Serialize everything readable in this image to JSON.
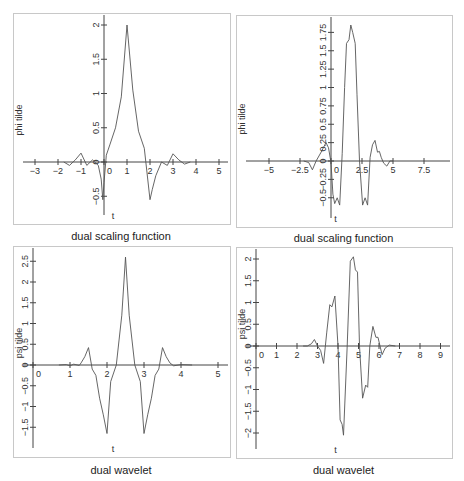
{
  "chart_data": [
    {
      "id": "p1",
      "type": "line",
      "title": "dual scaling function",
      "xlabel": "t",
      "ylabel": "phi tilde",
      "xlim": [
        -3.4,
        5.4
      ],
      "ylim": [
        -0.75,
        2.15
      ],
      "xticks": [
        -3,
        -2,
        -1,
        0,
        1,
        2,
        3,
        4,
        5
      ],
      "xtick_labels": [
        "−3",
        "−2",
        "−1",
        "0",
        "1",
        "2",
        "3",
        "4",
        "5"
      ],
      "yticks": [
        -0.5,
        0,
        0.5,
        1,
        1.5,
        2
      ],
      "ytick_labels": [
        "−0.5",
        "0",
        "0.5",
        "1",
        "1.5",
        "2"
      ],
      "grid": false,
      "frame": {
        "left": 13,
        "top": 13,
        "right": 229,
        "bottom": 223
      },
      "axis_px": {
        "x0": 104,
        "xscale": 23.0,
        "y0": 162,
        "yscale": 68.5
      },
      "x": [
        -1.75,
        -1.5,
        -1.25,
        -1.0,
        -0.75,
        -0.5,
        -0.25,
        -0.12,
        -0.05,
        0.0,
        0.1,
        0.25,
        0.5,
        0.75,
        1.0,
        1.25,
        1.5,
        1.75,
        2.0,
        2.1,
        2.25,
        2.5,
        2.75,
        3.0,
        3.25,
        3.5,
        3.75
      ],
      "values": [
        0.0,
        -0.05,
        0.03,
        0.13,
        -0.05,
        0.03,
        -0.05,
        -0.25,
        -0.55,
        -0.3,
        0.1,
        0.25,
        0.5,
        0.95,
        2.0,
        1.05,
        0.45,
        0.2,
        -0.55,
        -0.4,
        -0.2,
        0.0,
        -0.05,
        0.12,
        0.03,
        -0.03,
        0.0
      ]
    },
    {
      "id": "p2",
      "type": "line",
      "title": "dual scaling function",
      "xlabel": "t",
      "ylabel": "phi tilde",
      "xlim": [
        -6.2,
        9.8
      ],
      "ylim": [
        -0.7,
        1.95
      ],
      "xticks": [
        -5,
        -2.5,
        0,
        2.5,
        5,
        7.5
      ],
      "xtick_labels": [
        "−5",
        "−2.5",
        "0",
        "2.5",
        "5",
        "7.5"
      ],
      "yticks": [
        -0.5,
        -0.25,
        0,
        0.25,
        0.5,
        0.75,
        1,
        1.25,
        1.5,
        1.75
      ],
      "ytick_labels": [
        "−0.5",
        "−0.25",
        "0",
        "0.25",
        "0.5",
        "0.75",
        "1",
        "1.25",
        "1.5",
        "1.75"
      ],
      "grid": false,
      "frame": {
        "left": 236,
        "top": 15,
        "right": 451,
        "bottom": 226
      },
      "axis_px": {
        "x0": 331,
        "xscale": 12.4,
        "y0": 161,
        "yscale": 73.5
      },
      "x": [
        -2.2,
        -1.8,
        -1.5,
        -1.2,
        -0.8,
        -0.4,
        -0.2,
        0.0,
        0.15,
        0.3,
        0.5,
        0.7,
        0.9,
        1.1,
        1.25,
        1.45,
        1.6,
        1.75,
        1.95,
        2.1,
        2.3,
        2.55,
        2.75,
        2.95,
        3.15,
        3.35,
        3.55,
        3.75,
        3.9,
        4.05,
        4.25,
        4.5,
        4.75,
        5.0
      ],
      "values": [
        0.0,
        -0.02,
        -0.12,
        0.0,
        0.12,
        0.25,
        0.18,
        -0.02,
        -0.45,
        -0.58,
        -0.5,
        -0.6,
        0.1,
        1.0,
        1.6,
        1.65,
        1.85,
        1.75,
        1.6,
        0.9,
        0.0,
        -0.6,
        -0.5,
        -0.6,
        0.05,
        0.22,
        0.28,
        0.12,
        0.13,
        0.05,
        -0.03,
        -0.07,
        0.0,
        0.0
      ]
    },
    {
      "id": "p3",
      "type": "line",
      "title": "dual wavelet",
      "xlabel": "t",
      "ylabel": "psi tilde",
      "xlim": [
        -0.5,
        5.3
      ],
      "ylim": [
        -1.95,
        2.75
      ],
      "xticks": [
        0,
        1,
        2,
        3,
        4,
        5
      ],
      "xtick_labels": [
        "0",
        "1",
        "2",
        "3",
        "4",
        "5"
      ],
      "yticks": [
        -1.5,
        -1,
        -0.5,
        0,
        0.5,
        1,
        1.5,
        2,
        2.5
      ],
      "ytick_labels": [
        "−1.5",
        "−1",
        "−0.5",
        "0",
        "0.5",
        "1",
        "1.5",
        "2",
        "2.5"
      ],
      "grid": false,
      "frame": {
        "left": 13,
        "top": 246,
        "right": 229,
        "bottom": 456
      },
      "axis_px": {
        "x0": 33,
        "xscale": 37.0,
        "y0": 365,
        "yscale": 41.5
      },
      "x": [
        0.7,
        0.9,
        1.0,
        1.1,
        1.25,
        1.3,
        1.4,
        1.5,
        1.6,
        1.7,
        1.8,
        1.9,
        2.0,
        2.1,
        2.25,
        2.4,
        2.5,
        2.6,
        2.75,
        2.9,
        3.0,
        3.1,
        3.2,
        3.3,
        3.4,
        3.5,
        3.6,
        3.7,
        3.8,
        4.0,
        4.3
      ],
      "values": [
        0.0,
        0.01,
        -0.02,
        0.02,
        -0.01,
        0.05,
        0.2,
        0.42,
        -0.1,
        -0.25,
        -0.8,
        -1.2,
        -1.65,
        -0.4,
        0.0,
        1.2,
        2.6,
        1.2,
        0.0,
        -0.4,
        -1.65,
        -1.2,
        -0.8,
        -0.25,
        -0.1,
        0.42,
        0.2,
        0.05,
        -0.02,
        0.01,
        0.0
      ]
    },
    {
      "id": "p4",
      "type": "line",
      "title": "dual wavelet",
      "xlabel": "t",
      "ylabel": "psi tilde",
      "xlim": [
        -0.9,
        9.5
      ],
      "ylim": [
        -2.3,
        2.2
      ],
      "xticks": [
        0,
        1,
        2,
        3,
        4,
        5,
        6,
        7,
        8,
        9
      ],
      "xtick_labels": [
        "0",
        "1",
        "2",
        "3",
        "4",
        "5",
        "6",
        "7",
        "8",
        "9"
      ],
      "yticks": [
        -2,
        -1.5,
        -1,
        -0.5,
        0,
        0.5,
        1,
        1.5,
        2
      ],
      "ytick_labels": [
        "−2",
        "−1.5",
        "−1",
        "−0.5",
        "0",
        "0.5",
        "1",
        "1.5",
        "2"
      ],
      "grid": false,
      "frame": {
        "left": 236,
        "top": 247,
        "right": 451,
        "bottom": 457
      },
      "axis_px": {
        "x0": 256,
        "xscale": 20.5,
        "y0": 346,
        "yscale": 43.5
      },
      "x": [
        2.3,
        2.5,
        2.7,
        2.85,
        3.0,
        3.15,
        3.3,
        3.45,
        3.6,
        3.7,
        3.85,
        4.0,
        4.1,
        4.2,
        4.27,
        4.45,
        4.6,
        4.75,
        4.85,
        4.95,
        5.05,
        5.2,
        5.35,
        5.45,
        5.55,
        5.7,
        5.85,
        5.95,
        6.05,
        6.15,
        6.3,
        6.5,
        6.8
      ],
      "values": [
        0.0,
        0.0,
        0.05,
        0.15,
        0.0,
        -0.1,
        -0.4,
        0.3,
        0.95,
        0.9,
        1.15,
        0.0,
        -1.7,
        -1.8,
        -2.05,
        0.0,
        1.95,
        2.05,
        1.75,
        1.7,
        0.0,
        -1.2,
        -0.9,
        -0.95,
        0.0,
        0.45,
        0.2,
        0.2,
        0.0,
        -0.2,
        -0.05,
        0.02,
        0.0
      ]
    }
  ]
}
